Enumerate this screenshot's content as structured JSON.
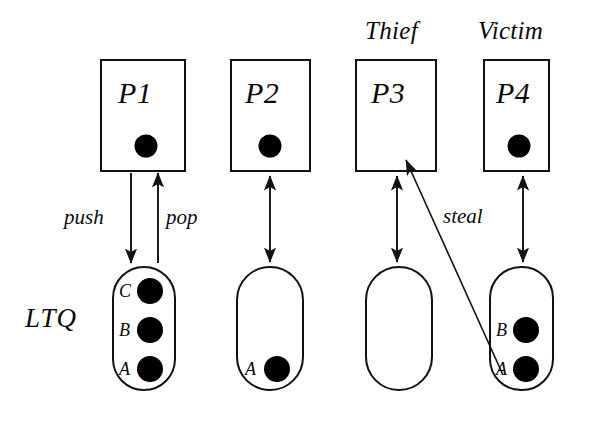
{
  "diagram": {
    "queue_label": "LTQ",
    "colors": {
      "stroke": "#111111",
      "fill_task": "#000000",
      "background": "#ffffff"
    },
    "roles": {
      "thief": "Thief",
      "victim": "Victim"
    },
    "edge_labels": {
      "push": "push",
      "pop": "pop",
      "steal": "steal"
    },
    "processes": [
      {
        "id": "p1",
        "label": "P1",
        "role": "",
        "has_task_dot": true,
        "queue_items": [
          "C",
          "B",
          "A"
        ],
        "edges": [
          "push",
          "pop"
        ]
      },
      {
        "id": "p2",
        "label": "P2",
        "role": "",
        "has_task_dot": true,
        "queue_items": [
          "A"
        ],
        "edges": [
          "bidirectional"
        ]
      },
      {
        "id": "p3",
        "label": "P3",
        "role": "Thief",
        "has_task_dot": false,
        "queue_items": [],
        "edges": [
          "bidirectional",
          "steal"
        ]
      },
      {
        "id": "p4",
        "label": "P4",
        "role": "Victim",
        "has_task_dot": true,
        "queue_items": [
          "B",
          "A"
        ],
        "edges": [
          "bidirectional"
        ]
      }
    ]
  }
}
